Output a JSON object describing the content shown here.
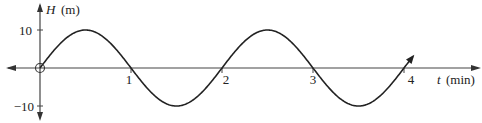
{
  "chart_data": {
    "type": "line",
    "title": "",
    "xlabel": "t",
    "xunit": "(min)",
    "ylabel": "H",
    "yunit": "(m)",
    "x_ticks": [
      "1",
      "2",
      "3",
      "4"
    ],
    "y_ticks": [
      "10",
      "−10"
    ],
    "ylim": [
      -10,
      10
    ],
    "xlim": [
      0,
      4.1
    ],
    "function": "H = 10 sin(pi t)",
    "amplitude": 10,
    "period_min": 2,
    "x": [
      0,
      0.5,
      1,
      1.5,
      2,
      2.5,
      3,
      3.5,
      4
    ],
    "series": [
      {
        "name": "H(t)",
        "values": [
          0,
          10,
          0,
          -10,
          0,
          10,
          0,
          -10,
          0
        ]
      }
    ],
    "open_circle_at": [
      0,
      0
    ],
    "grid": false,
    "legend": "none",
    "color": "#222222"
  },
  "labels": {
    "y_axis_var": "H",
    "y_axis_unit": "(m)",
    "x_axis_var": "t",
    "x_axis_unit": "(min)",
    "tick_y_pos": "10",
    "tick_y_neg": "−10",
    "tick_x_1": "1",
    "tick_x_2": "2",
    "tick_x_3": "3",
    "tick_x_4": "4"
  }
}
